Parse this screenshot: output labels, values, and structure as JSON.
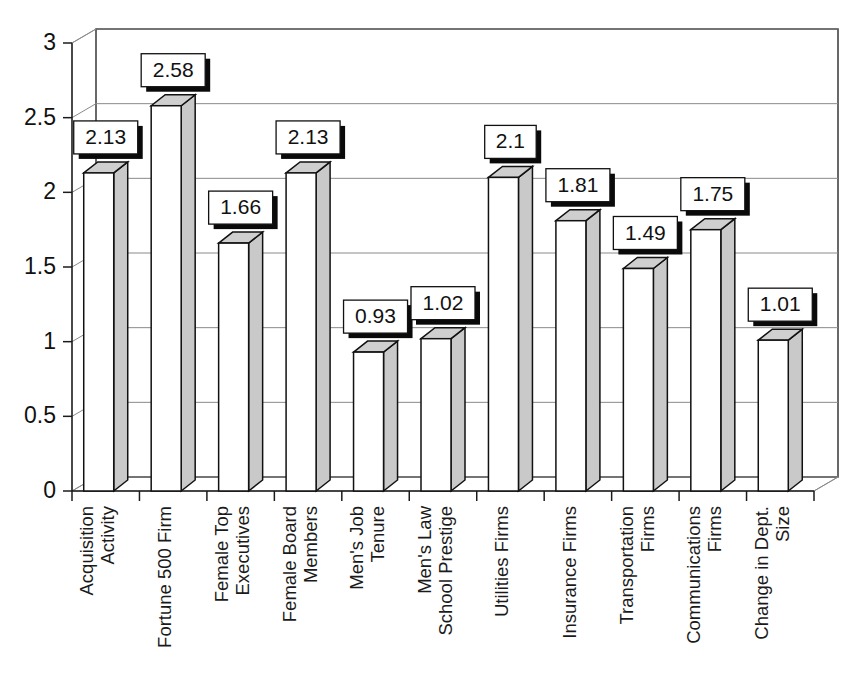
{
  "chart_data": {
    "type": "bar",
    "title": "",
    "subtitle": "",
    "xlabel": "",
    "ylabel": "",
    "ylim": [
      0,
      3
    ],
    "ytick_labels": [
      "0",
      "0.5",
      "1",
      "1.5",
      "2",
      "2.5",
      "3"
    ],
    "ytick_values": [
      0,
      0.5,
      1,
      1.5,
      2,
      2.5,
      3
    ],
    "grid": true,
    "grid_axis": "y",
    "legend": false,
    "legend_position": "none",
    "style": "3d-column",
    "colors": {
      "bar_front": "#ffffff",
      "bar_side": "#c9c9c9",
      "bar_top": "#cfcfcf",
      "bar_outline": "#111111",
      "grid": "#8a8a8a",
      "axis": "#1b1b1b",
      "label_box_fill": "#ffffff",
      "label_box_shadow": "#0a0a0a",
      "text": "#111111"
    },
    "categories": [
      "Acquisition Activity",
      "Fortune 500 Firm",
      "Female Top Executives",
      "Female Board Members",
      "Men's Job Tenure",
      "Men's Law School Prestige",
      "Utilities Firms",
      "Insurance Firms",
      "Transportation Firms",
      "Communications Firms",
      "Change in Dept. Size"
    ],
    "category_lines": [
      [
        "Acquisition",
        "Activity"
      ],
      [
        "Fortune 500 Firm"
      ],
      [
        "Female Top",
        "Executives"
      ],
      [
        "Female Board",
        "Members"
      ],
      [
        "Men's Job",
        "Tenure"
      ],
      [
        "Men's Law",
        "School Prestige"
      ],
      [
        "Utilities Firms"
      ],
      [
        "Insurance Firms"
      ],
      [
        "Transportation",
        "Firms"
      ],
      [
        "Communications",
        "Firms"
      ],
      [
        "Change in Dept.",
        "Size"
      ]
    ],
    "values": [
      2.13,
      2.58,
      1.66,
      2.13,
      0.93,
      1.02,
      2.1,
      1.81,
      1.49,
      1.75,
      1.01
    ],
    "value_labels": [
      "2.13",
      "2.58",
      "1.66",
      "2.13",
      "0.93",
      "1.02",
      "2.1",
      "1.81",
      "1.49",
      "1.75",
      "1.01"
    ]
  }
}
